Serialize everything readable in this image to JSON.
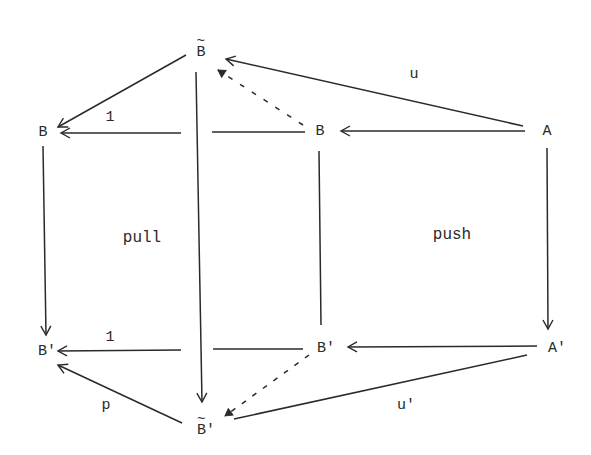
{
  "diagram": {
    "nodes": {
      "Btilde": {
        "label": "B",
        "decoration": "tilde",
        "x": 201,
        "y": 52
      },
      "B_left": {
        "label": "B",
        "x": 43,
        "y": 132
      },
      "B_mid": {
        "label": "B",
        "x": 320,
        "y": 131
      },
      "A": {
        "label": "A",
        "x": 547,
        "y": 131
      },
      "Bp_left": {
        "label": "B'",
        "x": 47,
        "y": 351
      },
      "Bp_mid": {
        "label": "B'",
        "x": 325,
        "y": 348
      },
      "Ap": {
        "label": "A'",
        "x": 555,
        "y": 348
      },
      "Btilde_p": {
        "label": "B'",
        "decoration": "tilde",
        "x": 204,
        "y": 428
      }
    },
    "edge_labels": {
      "u": "u",
      "one_top": "1",
      "one_bottom": "1",
      "p": "p",
      "u_prime": "u'"
    },
    "region_labels": {
      "pull": "pull",
      "push": "push"
    },
    "edges": [
      {
        "from": "Btilde",
        "to": "B_left",
        "style": "solid",
        "label": ""
      },
      {
        "from": "B_mid",
        "to": "B_left",
        "style": "solid",
        "label": "1"
      },
      {
        "from": "A",
        "to": "Btilde",
        "style": "solid",
        "label": "u"
      },
      {
        "from": "B_mid",
        "to": "Btilde",
        "style": "dashed",
        "label": ""
      },
      {
        "from": "A",
        "to": "B_mid",
        "style": "solid",
        "label": ""
      },
      {
        "from": "B_left",
        "to": "Bp_left",
        "style": "solid",
        "label": ""
      },
      {
        "from": "Btilde",
        "to": "Btilde_p",
        "style": "solid",
        "label": ""
      },
      {
        "from": "B_mid",
        "to": "Bp_mid",
        "style": "solid-no-arrow",
        "label": ""
      },
      {
        "from": "A",
        "to": "Ap",
        "style": "solid",
        "label": ""
      },
      {
        "from": "Bp_mid",
        "to": "Bp_left",
        "style": "solid",
        "label": "1"
      },
      {
        "from": "Ap",
        "to": "Bp_mid",
        "style": "solid",
        "label": ""
      },
      {
        "from": "Btilde_p",
        "to": "Bp_left",
        "style": "solid",
        "label": "p"
      },
      {
        "from": "Bp_mid",
        "to": "Btilde_p",
        "style": "dashed",
        "label": ""
      },
      {
        "from": "Ap",
        "to": "Btilde_p",
        "style": "solid",
        "label": "u'"
      }
    ],
    "colors": {
      "ink": "#2a2a2a",
      "background": "#ffffff"
    }
  }
}
